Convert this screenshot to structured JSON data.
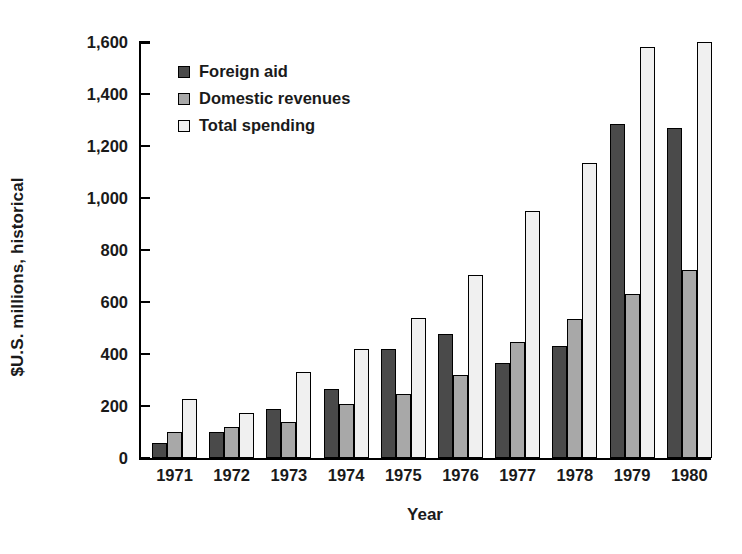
{
  "chart_data": {
    "type": "bar",
    "title": "",
    "subtitle": "",
    "xlabel": "Year",
    "ylabel": "$U.S. millions, historical",
    "categories": [
      "1971",
      "1972",
      "1973",
      "1974",
      "1975",
      "1976",
      "1977",
      "1978",
      "1979",
      "1980"
    ],
    "series": [
      {
        "name": "Foreign aid",
        "color": "#4a4a4a",
        "values": [
          58,
          100,
          188,
          265,
          420,
          478,
          365,
          430,
          1285,
          1270
        ]
      },
      {
        "name": "Domestic revenues",
        "color": "#a8a8a8",
        "values": [
          100,
          120,
          138,
          208,
          245,
          320,
          448,
          535,
          630,
          725
        ]
      },
      {
        "name": "Total spending",
        "color": "#f0f0f0",
        "values": [
          228,
          175,
          330,
          418,
          540,
          705,
          950,
          1135,
          1580,
          1600
        ]
      }
    ],
    "ylim": [
      0,
      1600
    ],
    "yticks": [
      0,
      200,
      400,
      600,
      800,
      1000,
      1200,
      1400,
      1600
    ],
    "ytick_labels": [
      "0",
      "200",
      "400",
      "600",
      "800",
      "1,000",
      "1,200",
      "1,400",
      "1,600"
    ],
    "grid": false,
    "legend_position": "top-left",
    "bar_border_color": "#000000"
  }
}
